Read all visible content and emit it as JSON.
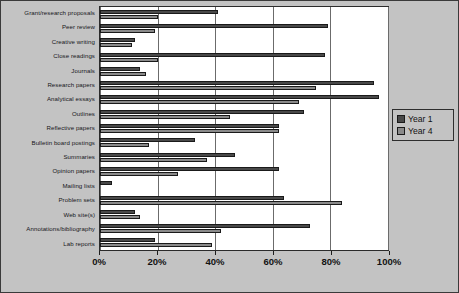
{
  "chart_data": {
    "type": "bar",
    "orientation": "horizontal",
    "title": "",
    "subtitle": "",
    "xlabel": "",
    "ylabel": "",
    "xlim": [
      0,
      100
    ],
    "xticks": [
      0,
      20,
      40,
      60,
      80,
      100
    ],
    "xtick_labels": [
      "0%",
      "20%",
      "40%",
      "60%",
      "80%",
      "100%"
    ],
    "grid": true,
    "grid_axis": "x",
    "legend_position": "right",
    "categories": [
      "Grant/research proposals",
      "Peer review",
      "Creative writing",
      "Close readings",
      "Journals",
      "Research papers",
      "Analytical essays",
      "Outlines",
      "Reflective papers",
      "Bulletin board postings",
      "Summaries",
      "Opinion papers",
      "Mailing lists",
      "Problem sets",
      "Web site(s)",
      "Annotations/bibliography",
      "Lab reports"
    ],
    "series": [
      {
        "name": "Year 1",
        "color": "#494949",
        "values": [
          41,
          79,
          12,
          78,
          14,
          95,
          97,
          71,
          62,
          33,
          47,
          62,
          4,
          64,
          12,
          73,
          19
        ]
      },
      {
        "name": "Year 4",
        "color": "#8a8a8a",
        "values": [
          20,
          19,
          11,
          20,
          16,
          75,
          69,
          45,
          62,
          17,
          37,
          27,
          0,
          84,
          14,
          42,
          39
        ]
      }
    ]
  },
  "legend": {
    "entries": [
      {
        "label": "Year 1"
      },
      {
        "label": "Year 4"
      }
    ]
  },
  "colors": {
    "background": "#c3c3c3",
    "plot_background": "#ffffff",
    "border": "#2b2b2b",
    "gridline": "#6b6b6b",
    "series_1": "#494949",
    "series_4": "#8a8a8a"
  }
}
